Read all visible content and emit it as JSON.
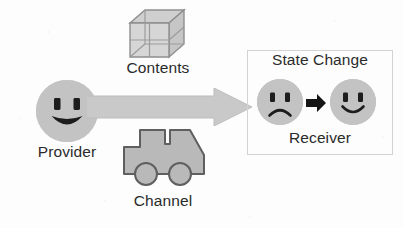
{
  "diagram": {
    "background_color": "#fdfdfd",
    "shape_fill": "#c3c3c3",
    "shape_stroke": "#6b6b6b",
    "text_color": "#2b2b2b",
    "panel_border_color": "#d3d3d3"
  },
  "labels": {
    "provider": "Provider",
    "contents": "Contents",
    "channel": "Channel",
    "state_change": "State Change",
    "receiver": "Receiver"
  },
  "icons": {
    "provider_face": "smiley-open-mouth-icon",
    "contents": "wireframe-cube-icon",
    "flow": "block-arrow-right-icon",
    "channel": "delivery-truck-icon",
    "receiver_before": "sad-face-icon",
    "receiver_after": "happy-face-icon",
    "transition": "small-arrow-right-icon"
  },
  "flow": {
    "from": "Provider",
    "to": "Receiver",
    "carries": "Contents",
    "via": "Channel",
    "effect": "State Change"
  }
}
